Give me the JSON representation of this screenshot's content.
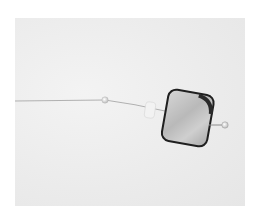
{
  "image": {
    "subject": "shell pendant on wire",
    "colors": {
      "background": "#ffffff",
      "fabric": "#ececec",
      "wire": "#9a9a9a",
      "bead": "#e8e8e8",
      "pendant_light": "#c9c9c9",
      "pendant_dark": "#2a2a2a"
    }
  }
}
